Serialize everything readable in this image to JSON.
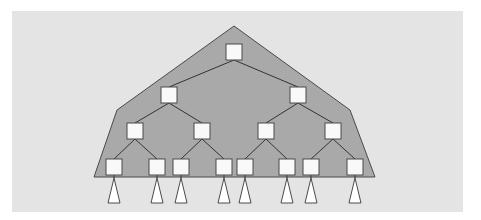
{
  "diagram": {
    "type": "binary-tree",
    "colors": {
      "background": "#ffffff",
      "panel": "#e4e4e4",
      "region_fill": "#a9a9a9",
      "region_stroke": "#4a4a4a",
      "node_fill": "#f9f9f9",
      "node_stroke": "#4a4a4a",
      "edge": "#333333",
      "subtree_fill": "#ffffff",
      "subtree_stroke": "#4a4a4a"
    },
    "region_polygon": [
      [
        234,
        26
      ],
      [
        350,
        110
      ],
      [
        375,
        177
      ],
      [
        94,
        177
      ],
      [
        117,
        110
      ]
    ],
    "node_size": 16,
    "levels": [
      {
        "depth": 0,
        "nodes": [
          {
            "id": "n0",
            "x": 226,
            "y": 44
          }
        ]
      },
      {
        "depth": 1,
        "nodes": [
          {
            "id": "n1",
            "x": 161,
            "y": 87
          },
          {
            "id": "n2",
            "x": 290,
            "y": 87
          }
        ]
      },
      {
        "depth": 2,
        "nodes": [
          {
            "id": "n3",
            "x": 127,
            "y": 123
          },
          {
            "id": "n4",
            "x": 194,
            "y": 123
          },
          {
            "id": "n5",
            "x": 258,
            "y": 123
          },
          {
            "id": "n6",
            "x": 325,
            "y": 123
          }
        ]
      },
      {
        "depth": 3,
        "nodes": [
          {
            "id": "n7",
            "x": 106,
            "y": 159
          },
          {
            "id": "n8",
            "x": 149,
            "y": 159
          },
          {
            "id": "n9",
            "x": 173,
            "y": 159
          },
          {
            "id": "n10",
            "x": 216,
            "y": 159
          },
          {
            "id": "n11",
            "x": 237,
            "y": 159
          },
          {
            "id": "n12",
            "x": 279,
            "y": 159
          },
          {
            "id": "n13",
            "x": 303,
            "y": 159
          },
          {
            "id": "n14",
            "x": 347,
            "y": 159
          }
        ]
      }
    ],
    "edges": [
      [
        "n0",
        "n1"
      ],
      [
        "n0",
        "n2"
      ],
      [
        "n1",
        "n3"
      ],
      [
        "n1",
        "n4"
      ],
      [
        "n2",
        "n5"
      ],
      [
        "n2",
        "n6"
      ],
      [
        "n3",
        "n7"
      ],
      [
        "n3",
        "n8"
      ],
      [
        "n4",
        "n9"
      ],
      [
        "n4",
        "n10"
      ],
      [
        "n5",
        "n11"
      ],
      [
        "n5",
        "n12"
      ],
      [
        "n6",
        "n13"
      ],
      [
        "n6",
        "n14"
      ]
    ],
    "subtrees": {
      "count": 8,
      "apex_y": 178,
      "base_y": 203,
      "half_width": 6
    }
  }
}
